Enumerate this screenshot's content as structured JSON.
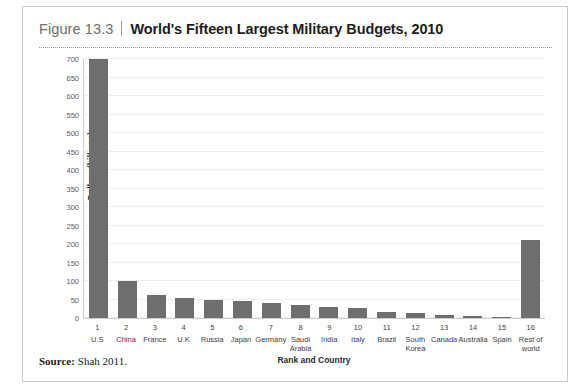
{
  "figure": {
    "number": "Figure 13.3",
    "title": "World's Fifteen Largest Military Budgets, 2010",
    "source_label": "Source:",
    "source_text": "Shah 2011."
  },
  "chart_data": {
    "type": "bar",
    "title": "World's Fifteen Largest Military Budgets, 2010",
    "xlabel": "Rank and Country",
    "ylabel": "Dollars (billions)",
    "ylim": [
      0,
      700
    ],
    "ytick_step": 50,
    "ytick_labels": [
      "0",
      "50",
      "100",
      "150",
      "200",
      "250",
      "300",
      "350",
      "400",
      "450",
      "500",
      "550",
      "600",
      "650",
      "700"
    ],
    "grid": true,
    "legend": "none",
    "bar_color": "#6e6e6e",
    "ranks": [
      "1",
      "2",
      "3",
      "4",
      "5",
      "6",
      "7",
      "8",
      "9",
      "10",
      "11",
      "12",
      "13",
      "14",
      "15",
      "16"
    ],
    "categories": [
      "U.S",
      "China",
      "France",
      "U.K",
      "Russia",
      "Japan",
      "Germany",
      "Saudi Arabia",
      "India",
      "Italy",
      "Brazil",
      "South Korea",
      "Canada",
      "Australia",
      "Spain",
      "Rest of world"
    ],
    "values": [
      700,
      99,
      61,
      54,
      50,
      47,
      41,
      36,
      29,
      26,
      15,
      14,
      7,
      5,
      3,
      210
    ]
  }
}
